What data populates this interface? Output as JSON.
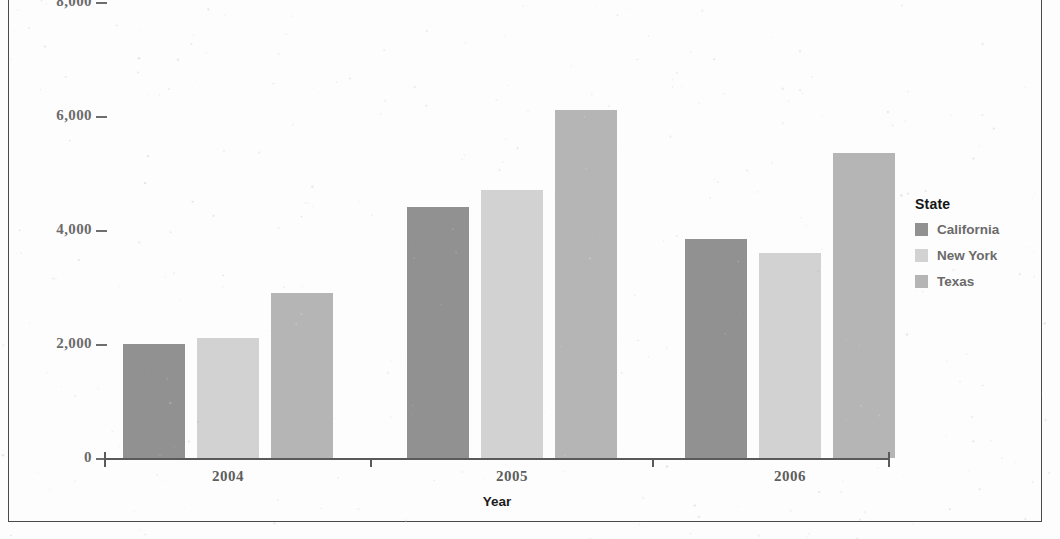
{
  "axes": {
    "y_title": "Quantity sold",
    "x_title": "Year",
    "y_ticks": [
      "8,000",
      "6,000",
      "4,000",
      "2,000",
      "0"
    ],
    "x_ticks": [
      "2004",
      "2005",
      "2006"
    ]
  },
  "legend": {
    "title": "State",
    "items": [
      {
        "label": "California",
        "color": "#919191"
      },
      {
        "label": "New York",
        "color": "#d2d2d2"
      },
      {
        "label": "Texas",
        "color": "#b5b5b5"
      }
    ]
  },
  "chart_data": {
    "type": "bar",
    "title": "",
    "subtitle": "",
    "xlabel": "Year",
    "ylabel": "Quantity sold",
    "categories": [
      "2004",
      "2005",
      "2006"
    ],
    "series": [
      {
        "name": "California",
        "color": "#919191",
        "values": [
          2000,
          4400,
          3850
        ]
      },
      {
        "name": "New York",
        "color": "#d2d2d2",
        "values": [
          2100,
          4700,
          3600
        ]
      },
      {
        "name": "Texas",
        "color": "#b5b5b5",
        "values": [
          2900,
          6100,
          5350
        ]
      }
    ],
    "ylim": [
      0,
      8000
    ],
    "yticks": [
      0,
      2000,
      4000,
      6000,
      8000
    ],
    "ytick_labels": [
      "0",
      "2,000",
      "4,000",
      "6,000",
      "8,000"
    ],
    "grid": false,
    "legend_position": "right",
    "legend_title": "State",
    "grouping": "grouped"
  }
}
